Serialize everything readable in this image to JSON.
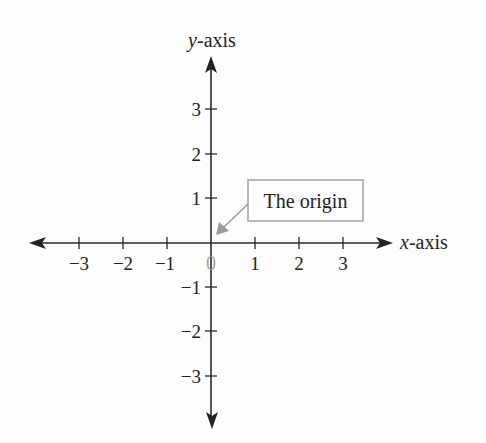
{
  "diagram": {
    "type": "cartesian-coordinate-plane",
    "x_axis": {
      "label_italic": "x",
      "label_rest": "-axis",
      "ticks": [
        "−3",
        "−2",
        "−1",
        "1",
        "2",
        "3"
      ],
      "tick_values": [
        -3,
        -2,
        -1,
        1,
        2,
        3
      ]
    },
    "y_axis": {
      "label_italic": "y",
      "label_rest": "-axis",
      "ticks": [
        "3",
        "2",
        "1",
        "−1",
        "−2",
        "−3"
      ],
      "tick_values": [
        3,
        2,
        1,
        -1,
        -2,
        -3
      ]
    },
    "origin_label": "0",
    "callout": {
      "text": "The origin",
      "points_to": "origin"
    },
    "colors": {
      "axis": "#2a2a2a",
      "text": "#222222",
      "callout_gray": "#9a9a9a",
      "origin_zero": "#a8a8a8",
      "background": "#fdfdfd"
    }
  }
}
